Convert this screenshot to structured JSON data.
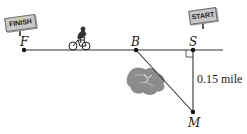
{
  "diagram": {
    "points": [
      {
        "id": "F",
        "label": "F",
        "x": 24,
        "y": 50
      },
      {
        "id": "B",
        "label": "B",
        "x": 136,
        "y": 50
      },
      {
        "id": "S",
        "label": "S",
        "x": 193,
        "y": 50
      },
      {
        "id": "M",
        "label": "M",
        "x": 193,
        "y": 112
      }
    ],
    "signs": {
      "finish": "FINISH",
      "start": "START"
    },
    "distance_label": "0.15 mile",
    "colors": {
      "line": "#333333",
      "sign_fill": "#c8c8c8",
      "mud": "#8a8a8a"
    }
  }
}
